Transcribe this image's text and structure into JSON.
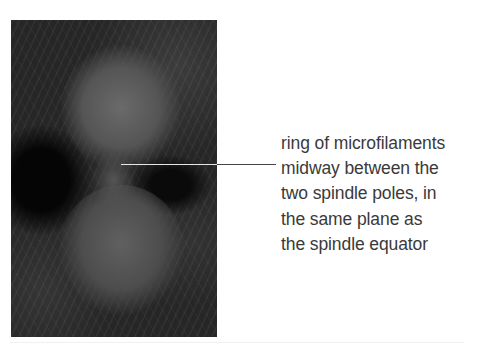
{
  "figure": {
    "micrograph": {
      "subject": "fluorescence micrograph of a dividing cell with contractile ring",
      "tone": "grayscale"
    },
    "label": {
      "lines": [
        "ring of microfilaments",
        "midway between the",
        "two spindle poles, in",
        "the same plane as",
        "the spindle equator"
      ]
    },
    "colors": {
      "text": "#3a3a3a",
      "leader_line_inside": "#e6e6e6",
      "leader_line_outside": "#444444",
      "background": "#ffffff"
    }
  }
}
